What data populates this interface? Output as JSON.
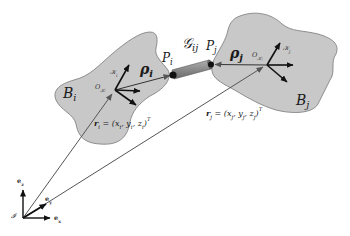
{
  "figure": {
    "type": "rigid-body connection diagram",
    "colors": {
      "body_fill": "#c8c8c8",
      "body_stroke": "#707070",
      "connector_fill": "#8c8c8c",
      "arrow": "#111111",
      "vector_line": "#555555",
      "background": "#ffffff"
    }
  },
  "bodies": [
    {
      "id": "i",
      "label": "B",
      "label_sub": "i",
      "frame_origin_label": "O",
      "frame_origin_sub": "𝒦ᵢ",
      "frame_label": "𝒦",
      "frame_label_sub": "i",
      "rho_label": "ρ",
      "rho_sub": "i",
      "point_label": "P",
      "point_sub": "i",
      "position_label": "r",
      "position_sub": "i",
      "position_eq": " = (x",
      "position_eq_parts": [
        "i",
        ", y",
        "i",
        ", z",
        "i",
        ")"
      ],
      "position_sup": "T"
    },
    {
      "id": "j",
      "label": "B",
      "label_sub": "j",
      "frame_origin_label": "O",
      "frame_origin_sub": "𝒦ⱼ",
      "frame_label": "𝒦",
      "frame_label_sub": "j",
      "rho_label": "ρ",
      "rho_sub": "j",
      "point_label": "P",
      "point_sub": "j",
      "position_label": "r",
      "position_sub": "j",
      "position_eq": " = (x",
      "position_eq_parts": [
        "j",
        ", y",
        "j",
        ", z",
        "j",
        ")"
      ],
      "position_sup": "T"
    }
  ],
  "connector": {
    "label": "𝒢",
    "label_sub": "ij"
  },
  "inertial_frame": {
    "origin_label": "𝓘",
    "axes": [
      {
        "name": "e",
        "sub": "x"
      },
      {
        "name": "e",
        "sub": "y"
      },
      {
        "name": "e",
        "sub": "z"
      }
    ]
  }
}
